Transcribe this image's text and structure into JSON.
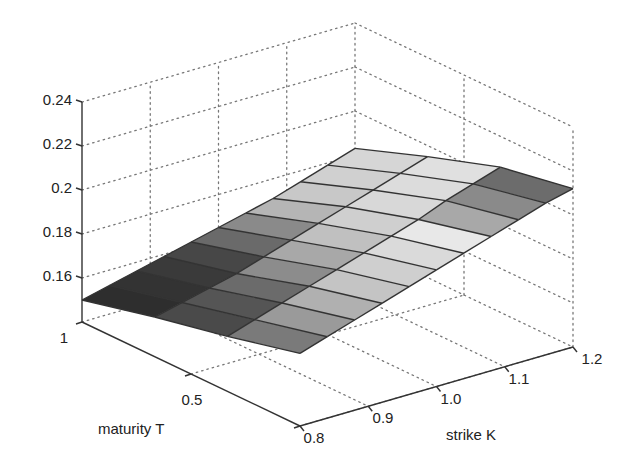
{
  "chart_data": {
    "type": "surface3d",
    "title": "",
    "xlabel": "strike K",
    "ylabel": "maturity T",
    "zlabel": "",
    "x_ticks": [
      "0.8",
      "0.9",
      "1.0",
      "1.1",
      "1.2"
    ],
    "y_ticks": [
      "1",
      "0.5"
    ],
    "z_ticks": [
      "0.16",
      "0.18",
      "0.2",
      "0.22",
      "0.24"
    ],
    "xlim": [
      0.8,
      1.2
    ],
    "ylim": [
      0,
      1
    ],
    "zlim": [
      0.14,
      0.24
    ],
    "grid": true,
    "colormap": "gray",
    "K": [
      0.8,
      0.84,
      0.88,
      0.92,
      0.96,
      1.0,
      1.04,
      1.08,
      1.12,
      1.16,
      1.2
    ],
    "T": [
      1.0,
      0.667,
      0.333,
      0.0
    ],
    "Z": [
      [
        0.15,
        0.153,
        0.156,
        0.159,
        0.162,
        0.165,
        0.168,
        0.171,
        0.175,
        0.179,
        0.183
      ],
      [
        0.158,
        0.161,
        0.164,
        0.167,
        0.171,
        0.175,
        0.179,
        0.183,
        0.187,
        0.191,
        0.195
      ],
      [
        0.165,
        0.169,
        0.173,
        0.177,
        0.181,
        0.185,
        0.189,
        0.193,
        0.198,
        0.202,
        0.206
      ],
      [
        0.173,
        0.177,
        0.181,
        0.185,
        0.189,
        0.193,
        0.197,
        0.201,
        0.205,
        0.209,
        0.212
      ]
    ],
    "panel_shades": [
      [
        "#2e2e2e",
        "#333333",
        "#3a3a3a",
        "#474747",
        "#6a6a6a",
        "#8a8a8a",
        "#b5b5b5",
        "#c8c8c8",
        "#d0d0d0",
        "#d6d6d6"
      ],
      [
        "#4a4a4a",
        "#555555",
        "#6b6b6b",
        "#8c8c8c",
        "#a8a8a8",
        "#c0c0c0",
        "#cfcfcf",
        "#d8d8d8",
        "#dcdcdc",
        "#e0e0e0"
      ],
      [
        "#7a7a7a",
        "#9a9a9a",
        "#b0b0b0",
        "#c4c4c4",
        "#cfcfcf",
        "#dadada",
        "#e8e8e8",
        "#a8a8a8",
        "#8a8a8a",
        "#6c6c6c"
      ]
    ]
  },
  "axes": {
    "x_label": "strike K",
    "y_label": "maturity T",
    "x_ticks": [
      "0.8",
      "0.9",
      "1.0",
      "1.1",
      "1.2"
    ],
    "y_ticks": [
      "1",
      "0.5"
    ],
    "z_ticks": [
      "0.16",
      "0.18",
      "0.2",
      "0.22",
      "0.24"
    ]
  }
}
